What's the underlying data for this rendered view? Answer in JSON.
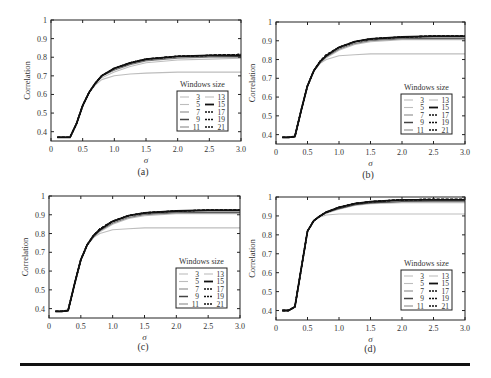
{
  "figure": {
    "legend_title": "Windows size",
    "ylabel": "Correlation",
    "xlabel": "σ",
    "x_ticks": [
      0,
      0.5,
      1.0,
      1.5,
      2.0,
      2.5,
      3.0
    ],
    "x_tick_labels": [
      "0",
      "0.5",
      "1.0",
      "1.5",
      "2.0",
      "2.5",
      "3.0"
    ]
  },
  "chart_data": [
    {
      "type": "line",
      "panel": "(a)",
      "xlabel": "σ",
      "ylabel": "Correlation",
      "xlim": [
        0,
        3.0
      ],
      "ylim": [
        0.35,
        1.0
      ],
      "y_ticks": [
        0.4,
        0.5,
        0.6,
        0.7,
        0.8,
        0.9,
        1
      ],
      "y_tick_labels": [
        "0.4",
        "0.5",
        "0.6",
        "0.7",
        "0.8",
        "0.9",
        "1"
      ],
      "legend_title": "Windows size",
      "legend_position": "lower right",
      "x": [
        0.1,
        0.2,
        0.3,
        0.4,
        0.5,
        0.6,
        0.7,
        0.8,
        1.0,
        1.25,
        1.5,
        2.0,
        2.5,
        3.0
      ],
      "series": [
        {
          "name": "3",
          "style": "solid-light",
          "values": [
            0.37,
            0.37,
            0.37,
            0.44,
            0.54,
            0.61,
            0.65,
            0.68,
            0.7,
            0.71,
            0.715,
            0.72,
            0.72,
            0.72
          ]
        },
        {
          "name": "5",
          "style": "solid-light",
          "values": [
            0.37,
            0.37,
            0.37,
            0.44,
            0.54,
            0.61,
            0.66,
            0.69,
            0.72,
            0.75,
            0.77,
            0.785,
            0.79,
            0.795
          ]
        },
        {
          "name": "7",
          "style": "solid-mid",
          "values": [
            0.37,
            0.37,
            0.37,
            0.44,
            0.54,
            0.61,
            0.66,
            0.7,
            0.73,
            0.76,
            0.78,
            0.795,
            0.8,
            0.8
          ]
        },
        {
          "name": "9",
          "style": "solid-dark",
          "values": [
            0.37,
            0.37,
            0.37,
            0.44,
            0.54,
            0.61,
            0.66,
            0.7,
            0.735,
            0.765,
            0.785,
            0.8,
            0.805,
            0.805
          ]
        },
        {
          "name": "11",
          "style": "solid-mid",
          "values": [
            0.37,
            0.37,
            0.37,
            0.44,
            0.54,
            0.61,
            0.66,
            0.7,
            0.735,
            0.765,
            0.785,
            0.8,
            0.805,
            0.81
          ]
        },
        {
          "name": "13",
          "style": "solid-light",
          "values": [
            0.37,
            0.37,
            0.37,
            0.44,
            0.54,
            0.61,
            0.66,
            0.7,
            0.735,
            0.77,
            0.79,
            0.8,
            0.81,
            0.81
          ]
        },
        {
          "name": "15",
          "style": "solid-black",
          "values": [
            0.37,
            0.37,
            0.37,
            0.44,
            0.54,
            0.61,
            0.66,
            0.7,
            0.74,
            0.77,
            0.79,
            0.805,
            0.81,
            0.81
          ]
        },
        {
          "name": "17",
          "style": "dashed-black",
          "values": [
            0.37,
            0.37,
            0.37,
            0.44,
            0.54,
            0.61,
            0.66,
            0.7,
            0.74,
            0.77,
            0.79,
            0.805,
            0.81,
            0.815
          ]
        },
        {
          "name": "19",
          "style": "dashed-black",
          "values": [
            0.37,
            0.37,
            0.37,
            0.44,
            0.54,
            0.61,
            0.66,
            0.7,
            0.74,
            0.77,
            0.79,
            0.805,
            0.81,
            0.815
          ]
        },
        {
          "name": "21",
          "style": "dashed-black",
          "values": [
            0.37,
            0.37,
            0.37,
            0.44,
            0.54,
            0.61,
            0.66,
            0.7,
            0.74,
            0.77,
            0.79,
            0.805,
            0.81,
            0.815
          ]
        }
      ]
    },
    {
      "type": "line",
      "panel": "(b)",
      "xlabel": "σ",
      "ylabel": "Correlation",
      "xlim": [
        0,
        3.0
      ],
      "ylim": [
        0.35,
        1.0
      ],
      "y_ticks": [
        0.4,
        0.5,
        0.6,
        0.7,
        0.8,
        0.9,
        1
      ],
      "y_tick_labels": [
        "0.4",
        "0.5",
        "0.6",
        "0.7",
        "0.8",
        "0.9",
        "1"
      ],
      "legend_title": "Windows size",
      "legend_position": "lower right",
      "x": [
        0.1,
        0.2,
        0.3,
        0.4,
        0.5,
        0.6,
        0.7,
        0.8,
        1.0,
        1.25,
        1.5,
        2.0,
        2.5,
        3.0
      ],
      "series": [
        {
          "name": "3",
          "style": "solid-light",
          "values": [
            0.385,
            0.385,
            0.39,
            0.53,
            0.66,
            0.74,
            0.78,
            0.8,
            0.82,
            0.825,
            0.83,
            0.83,
            0.83,
            0.83
          ]
        },
        {
          "name": "5",
          "style": "solid-light",
          "values": [
            0.385,
            0.385,
            0.39,
            0.53,
            0.66,
            0.74,
            0.78,
            0.81,
            0.85,
            0.88,
            0.895,
            0.905,
            0.905,
            0.905
          ]
        },
        {
          "name": "7",
          "style": "solid-mid",
          "values": [
            0.385,
            0.385,
            0.39,
            0.53,
            0.66,
            0.74,
            0.785,
            0.815,
            0.855,
            0.885,
            0.9,
            0.91,
            0.91,
            0.91
          ]
        },
        {
          "name": "9",
          "style": "solid-dark",
          "values": [
            0.385,
            0.385,
            0.39,
            0.53,
            0.66,
            0.74,
            0.785,
            0.82,
            0.86,
            0.89,
            0.905,
            0.915,
            0.915,
            0.915
          ]
        },
        {
          "name": "11",
          "style": "solid-mid",
          "values": [
            0.385,
            0.385,
            0.39,
            0.53,
            0.66,
            0.74,
            0.785,
            0.82,
            0.86,
            0.89,
            0.905,
            0.915,
            0.92,
            0.92
          ]
        },
        {
          "name": "13",
          "style": "solid-light",
          "values": [
            0.385,
            0.385,
            0.39,
            0.53,
            0.66,
            0.74,
            0.79,
            0.82,
            0.86,
            0.89,
            0.91,
            0.92,
            0.92,
            0.92
          ]
        },
        {
          "name": "15",
          "style": "solid-black",
          "values": [
            0.385,
            0.385,
            0.39,
            0.53,
            0.66,
            0.74,
            0.79,
            0.82,
            0.865,
            0.895,
            0.91,
            0.92,
            0.925,
            0.925
          ]
        },
        {
          "name": "17",
          "style": "dashed-black",
          "values": [
            0.385,
            0.385,
            0.39,
            0.53,
            0.66,
            0.74,
            0.79,
            0.825,
            0.865,
            0.895,
            0.91,
            0.92,
            0.925,
            0.925
          ]
        },
        {
          "name": "19",
          "style": "dashed-black",
          "values": [
            0.385,
            0.385,
            0.39,
            0.53,
            0.66,
            0.74,
            0.79,
            0.825,
            0.865,
            0.895,
            0.91,
            0.92,
            0.925,
            0.925
          ]
        },
        {
          "name": "21",
          "style": "dashed-black",
          "values": [
            0.385,
            0.385,
            0.39,
            0.53,
            0.66,
            0.74,
            0.79,
            0.825,
            0.865,
            0.895,
            0.91,
            0.92,
            0.925,
            0.925
          ]
        }
      ]
    },
    {
      "type": "line",
      "panel": "(c)",
      "xlabel": "σ",
      "ylabel": "Correlation",
      "xlim": [
        0,
        3.0
      ],
      "ylim": [
        0.35,
        1.0
      ],
      "y_ticks": [
        0.4,
        0.5,
        0.6,
        0.7,
        0.8,
        0.9,
        1
      ],
      "y_tick_labels": [
        "0.4",
        "0.5",
        "0.6",
        "0.7",
        "0.8",
        "0.9",
        "1"
      ],
      "legend_title": "Windows size",
      "legend_position": "lower right",
      "x": [
        0.1,
        0.2,
        0.3,
        0.4,
        0.5,
        0.6,
        0.7,
        0.8,
        1.0,
        1.25,
        1.5,
        2.0,
        2.5,
        3.0
      ],
      "series": [
        {
          "name": "3",
          "style": "solid-light",
          "values": [
            0.385,
            0.385,
            0.39,
            0.53,
            0.66,
            0.74,
            0.78,
            0.8,
            0.82,
            0.825,
            0.83,
            0.83,
            0.83,
            0.83
          ]
        },
        {
          "name": "5",
          "style": "solid-light",
          "values": [
            0.385,
            0.385,
            0.39,
            0.53,
            0.66,
            0.74,
            0.78,
            0.81,
            0.85,
            0.88,
            0.895,
            0.905,
            0.905,
            0.905
          ]
        },
        {
          "name": "7",
          "style": "solid-mid",
          "values": [
            0.385,
            0.385,
            0.39,
            0.53,
            0.66,
            0.74,
            0.785,
            0.815,
            0.855,
            0.885,
            0.9,
            0.91,
            0.91,
            0.91
          ]
        },
        {
          "name": "9",
          "style": "solid-dark",
          "values": [
            0.385,
            0.385,
            0.39,
            0.53,
            0.66,
            0.74,
            0.785,
            0.82,
            0.86,
            0.89,
            0.905,
            0.915,
            0.915,
            0.915
          ]
        },
        {
          "name": "11",
          "style": "solid-mid",
          "values": [
            0.385,
            0.385,
            0.39,
            0.53,
            0.66,
            0.74,
            0.785,
            0.82,
            0.86,
            0.89,
            0.905,
            0.915,
            0.92,
            0.92
          ]
        },
        {
          "name": "13",
          "style": "solid-light",
          "values": [
            0.385,
            0.385,
            0.39,
            0.53,
            0.66,
            0.74,
            0.79,
            0.82,
            0.86,
            0.89,
            0.91,
            0.92,
            0.92,
            0.92
          ]
        },
        {
          "name": "15",
          "style": "solid-black",
          "values": [
            0.385,
            0.385,
            0.39,
            0.53,
            0.66,
            0.74,
            0.79,
            0.82,
            0.865,
            0.895,
            0.91,
            0.92,
            0.925,
            0.925
          ]
        },
        {
          "name": "17",
          "style": "dashed-black",
          "values": [
            0.385,
            0.385,
            0.39,
            0.53,
            0.66,
            0.74,
            0.79,
            0.825,
            0.865,
            0.895,
            0.91,
            0.92,
            0.925,
            0.925
          ]
        },
        {
          "name": "19",
          "style": "dashed-black",
          "values": [
            0.385,
            0.385,
            0.39,
            0.53,
            0.66,
            0.74,
            0.79,
            0.825,
            0.865,
            0.895,
            0.91,
            0.92,
            0.925,
            0.925
          ]
        },
        {
          "name": "21",
          "style": "dashed-black",
          "values": [
            0.385,
            0.385,
            0.39,
            0.53,
            0.66,
            0.74,
            0.79,
            0.825,
            0.865,
            0.895,
            0.91,
            0.92,
            0.925,
            0.925
          ]
        }
      ]
    },
    {
      "type": "line",
      "panel": "(d)",
      "xlabel": "σ",
      "ylabel": "Correlation",
      "xlim": [
        0,
        3.0
      ],
      "ylim": [
        0.35,
        1.0
      ],
      "y_ticks": [
        0.4,
        0.5,
        0.6,
        0.7,
        0.8,
        0.9,
        1
      ],
      "y_tick_labels": [
        "0.4",
        "0.5",
        "0.6",
        "0.7",
        "0.8",
        "0.9",
        "1"
      ],
      "legend_title": "Windows size",
      "legend_position": "lower right",
      "x": [
        0.1,
        0.2,
        0.3,
        0.4,
        0.5,
        0.6,
        0.7,
        0.8,
        1.0,
        1.25,
        1.5,
        2.0,
        2.5,
        3.0
      ],
      "series": [
        {
          "name": "3",
          "style": "solid-light",
          "values": [
            0.4,
            0.4,
            0.42,
            0.62,
            0.82,
            0.875,
            0.895,
            0.905,
            0.91,
            0.91,
            0.91,
            0.91,
            0.91,
            0.91
          ]
        },
        {
          "name": "5",
          "style": "solid-light",
          "values": [
            0.4,
            0.4,
            0.42,
            0.62,
            0.82,
            0.875,
            0.9,
            0.915,
            0.935,
            0.955,
            0.965,
            0.97,
            0.97,
            0.97
          ]
        },
        {
          "name": "7",
          "style": "solid-mid",
          "values": [
            0.4,
            0.4,
            0.42,
            0.62,
            0.82,
            0.875,
            0.9,
            0.915,
            0.94,
            0.96,
            0.97,
            0.975,
            0.975,
            0.975
          ]
        },
        {
          "name": "9",
          "style": "solid-dark",
          "values": [
            0.4,
            0.4,
            0.42,
            0.62,
            0.82,
            0.875,
            0.9,
            0.92,
            0.94,
            0.96,
            0.97,
            0.978,
            0.98,
            0.98
          ]
        },
        {
          "name": "11",
          "style": "solid-mid",
          "values": [
            0.4,
            0.4,
            0.42,
            0.62,
            0.82,
            0.875,
            0.9,
            0.92,
            0.945,
            0.965,
            0.975,
            0.98,
            0.98,
            0.98
          ]
        },
        {
          "name": "13",
          "style": "solid-light",
          "values": [
            0.4,
            0.4,
            0.42,
            0.62,
            0.82,
            0.875,
            0.9,
            0.92,
            0.945,
            0.965,
            0.975,
            0.982,
            0.985,
            0.985
          ]
        },
        {
          "name": "15",
          "style": "solid-black",
          "values": [
            0.4,
            0.4,
            0.42,
            0.62,
            0.82,
            0.875,
            0.9,
            0.92,
            0.945,
            0.965,
            0.975,
            0.985,
            0.985,
            0.985
          ]
        },
        {
          "name": "17",
          "style": "dashed-black",
          "values": [
            0.4,
            0.4,
            0.42,
            0.62,
            0.82,
            0.875,
            0.9,
            0.92,
            0.945,
            0.965,
            0.975,
            0.985,
            0.988,
            0.988
          ]
        },
        {
          "name": "19",
          "style": "dashed-black",
          "values": [
            0.4,
            0.4,
            0.42,
            0.62,
            0.82,
            0.875,
            0.9,
            0.92,
            0.945,
            0.965,
            0.975,
            0.985,
            0.988,
            0.988
          ]
        },
        {
          "name": "21",
          "style": "dashed-black",
          "values": [
            0.4,
            0.4,
            0.42,
            0.62,
            0.82,
            0.875,
            0.9,
            0.92,
            0.945,
            0.965,
            0.975,
            0.985,
            0.988,
            0.988
          ]
        }
      ]
    }
  ],
  "layout": {
    "panels": [
      {
        "left": 51,
        "top": 20,
        "right": 241,
        "bottom": 141,
        "caption_x": 143,
        "caption_y": 175,
        "ylabel_x": 30
      },
      {
        "left": 276,
        "top": 22,
        "right": 465,
        "bottom": 144,
        "caption_x": 368,
        "caption_y": 178,
        "ylabel_x": 255
      },
      {
        "left": 49,
        "top": 196,
        "right": 240,
        "bottom": 318,
        "caption_x": 143,
        "caption_y": 350,
        "ylabel_x": 28
      },
      {
        "left": 276,
        "top": 197,
        "right": 465,
        "bottom": 320,
        "caption_x": 370,
        "caption_y": 352,
        "ylabel_x": 255
      }
    ],
    "style_colors": {
      "solid-light": "#bdbdbd",
      "solid-mid": "#8a8a8a",
      "solid-dark": "#444444",
      "solid-black": "#111111",
      "dashed-black": "#111111"
    }
  }
}
